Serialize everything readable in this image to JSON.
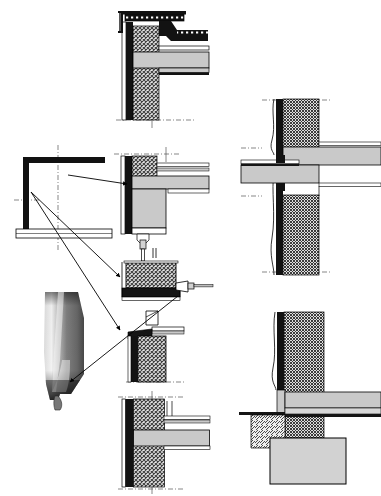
{
  "sheet": {
    "title": "Construction Detail Sheet",
    "subtitle": "Wall / floor / roof junction sections",
    "background": "#ffffff",
    "width": 381,
    "height": 496
  },
  "palette": {
    "paper": "#ffffff",
    "ink": "#000000",
    "insulation_black": "#111111",
    "concrete_gray": "#c9c9c9",
    "concrete_gray_light": "#d8d8d8",
    "masonry_hatch_fg": "#3a3a3a",
    "masonry_hatch_bg": "#e6e6e6",
    "screed_gray": "#bdbdbd",
    "metal_gray": "#9a9a9a",
    "photo_mid": "#8f8f8f",
    "photo_light": "#e8e8e8",
    "photo_dark": "#1b1b1b",
    "axis_dash": "#555555"
  },
  "details": [
    {
      "id": "detail-parapet-roof-edge",
      "name": "parapet-roof-edge-detail",
      "position": "top-center",
      "x": 110,
      "y": 8,
      "w": 105,
      "h": 115,
      "description": "Parapet head with metal coping, waterproof membrane, insulation and cross-hatched masonry wall with cast floor slab"
    },
    {
      "id": "detail-window-head-sill",
      "name": "window-head-and-floor-junction-detail",
      "position": "middle-center-upper",
      "x": 110,
      "y": 140,
      "w": 105,
      "h": 115,
      "description": "Floor slab to external wall junction showing insulation layer, rendered face and suspended fixing rod"
    },
    {
      "id": "detail-window-frame-bracket",
      "name": "window-frame-bracket-detail",
      "position": "middle-center",
      "x": 118,
      "y": 258,
      "w": 95,
      "h": 50,
      "description": "Masonry block on bearing plate with metal bracket and anchor projecting to the right"
    },
    {
      "id": "detail-sill-upstand",
      "name": "sill-upstand-detail",
      "position": "middle-center-lower",
      "x": 118,
      "y": 308,
      "w": 95,
      "h": 80,
      "description": "Sill flashing and upstand on hatched masonry pier with black insulation face"
    },
    {
      "id": "detail-intermediate-floor",
      "name": "intermediate-floor-wall-detail",
      "position": "bottom-center",
      "x": 112,
      "y": 392,
      "w": 105,
      "h": 100,
      "description": "Intermediate floor slab bearing into insulated cavity wall"
    },
    {
      "id": "detail-balcony-slab",
      "name": "balcony-slab-wall-junction-detail",
      "position": "right-upper",
      "x": 236,
      "y": 90,
      "w": 145,
      "h": 190,
      "description": "Cantilevered balcony slab passing through insulated wall with thermal break and soffit lining"
    },
    {
      "id": "detail-foundation-base",
      "name": "foundation-base-detail",
      "position": "right-lower",
      "x": 236,
      "y": 305,
      "w": 145,
      "h": 185,
      "description": "Ground floor slab on hatched fill with perimeter insulation over strip footing"
    }
  ],
  "key_elevation": {
    "name": "key-elevation-diagram",
    "x": 14,
    "y": 146,
    "w": 110,
    "h": 100,
    "description": "Small key section showing wall, roof and floor outline with centre-lines"
  },
  "photo_inset": {
    "name": "component-photo-inset",
    "x": 33,
    "y": 292,
    "w": 58,
    "h": 108,
    "description": "Photograph of a tapered metal rainwater outlet / gutter spout"
  },
  "leaders": [
    {
      "name": "leader-keyplan-to-window-head",
      "from": [
        68,
        177
      ],
      "to": [
        128,
        183
      ]
    },
    {
      "name": "leader-keyplan-to-frame-bracket",
      "from": [
        60,
        172
      ],
      "to": [
        122,
        277
      ]
    },
    {
      "name": "leader-keyplan-to-sill",
      "from": [
        60,
        176
      ],
      "to": [
        122,
        331
      ]
    },
    {
      "name": "leader-bracket-to-photo",
      "from": [
        178,
        297
      ],
      "to": [
        70,
        382
      ]
    }
  ],
  "annotations": {
    "centre_line_style": "dash-dot",
    "hatch_masonry": "diagonal cross-hatch",
    "hatch_fill": "single diagonal hatch",
    "units": "mm"
  }
}
